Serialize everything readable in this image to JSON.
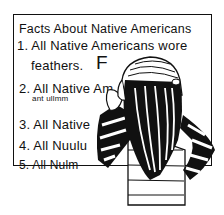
{
  "illustration": {
    "description": "Hand-drawn cartoon of a girl with long hair and a striped sweater looking at a board listing facts",
    "board": {
      "title": "Facts About Native Americans",
      "items": [
        {
          "line": "1. All Native Americans wore",
          "continuation": "feathers.",
          "grade": "F"
        },
        {
          "line": "2. All Native Am",
          "continuation": "ant ullmm"
        },
        {
          "line": "3. All Native"
        },
        {
          "line": "4. All Nuulu"
        },
        {
          "line": "5. All Nulm"
        }
      ]
    },
    "colors": {
      "ink": "#111111",
      "paper": "#ffffff"
    }
  }
}
